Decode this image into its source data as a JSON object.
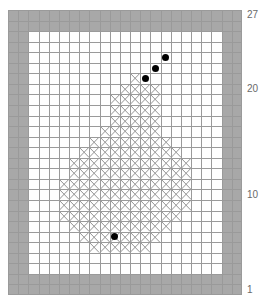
{
  "pattern": {
    "cols": 23,
    "rows": 27,
    "border_width_cells": 2,
    "colors": {
      "background": "#ffffff",
      "border_fill": "#a8a8a8",
      "gridline": "#9a9a9a",
      "cross_stitch": "#8c8c8c",
      "dot": "#000000",
      "label": "#6a6a6a"
    },
    "cross_rows": [
      {
        "row": 6,
        "from": 12,
        "to": 12
      },
      {
        "row": 7,
        "from": 11,
        "to": 14
      },
      {
        "row": 8,
        "from": 10,
        "to": 14
      },
      {
        "row": 9,
        "from": 10,
        "to": 14
      },
      {
        "row": 10,
        "from": 10,
        "to": 14
      },
      {
        "row": 11,
        "from": 9,
        "to": 14
      },
      {
        "row": 12,
        "from": 8,
        "to": 15
      },
      {
        "row": 13,
        "from": 7,
        "to": 16
      },
      {
        "row": 14,
        "from": 6,
        "to": 17
      },
      {
        "row": 15,
        "from": 6,
        "to": 17
      },
      {
        "row": 16,
        "from": 5,
        "to": 17
      },
      {
        "row": 17,
        "from": 5,
        "to": 17
      },
      {
        "row": 18,
        "from": 5,
        "to": 17
      },
      {
        "row": 19,
        "from": 5,
        "to": 16
      },
      {
        "row": 20,
        "from": 6,
        "to": 15
      },
      {
        "row": 21,
        "from": 7,
        "to": 14
      },
      {
        "row": 22,
        "from": 8,
        "to": 13
      }
    ],
    "dots": [
      {
        "row": 4,
        "col": 15
      },
      {
        "row": 5,
        "col": 14
      },
      {
        "row": 6,
        "col": 13
      },
      {
        "row": 21,
        "col": 10
      }
    ],
    "row_labels": [
      {
        "text": "27",
        "row": 0
      },
      {
        "text": "20",
        "row": 7
      },
      {
        "text": "10",
        "row": 17
      },
      {
        "text": "1",
        "row": 26
      }
    ]
  }
}
